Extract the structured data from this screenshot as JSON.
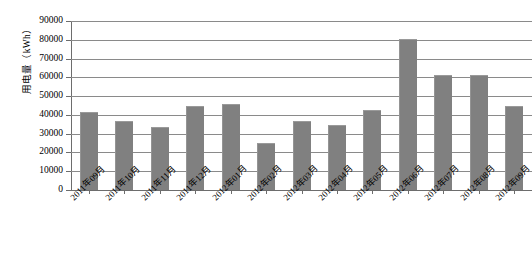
{
  "chart_data": {
    "type": "bar",
    "title": "",
    "xlabel": "",
    "ylabel": "用电量（kWh）",
    "ylim": [
      0,
      90000
    ],
    "ytick_step": 10000,
    "yticks": [
      "0",
      "10000",
      "20000",
      "30000",
      "40000",
      "50000",
      "60000",
      "70000",
      "80000",
      "90000"
    ],
    "grid": true,
    "legend": "none",
    "bar_color": "#808080",
    "gridline_color": "#8a8a8a",
    "axis_color": "#6d6d6d",
    "background_color": "#ffffff",
    "categories": [
      "2011年09月",
      "2011年10月",
      "2011年11月",
      "2011年12月",
      "2012年01月",
      "2012年02月",
      "2012年03月",
      "2012年04月",
      "2012年05月",
      "2012年06月",
      "2012年07月",
      "2012年08月",
      "2012年09月"
    ],
    "values": [
      41500,
      37000,
      33500,
      45000,
      46000,
      25000,
      37000,
      34500,
      42500,
      80500,
      61000,
      61000,
      44500
    ]
  }
}
